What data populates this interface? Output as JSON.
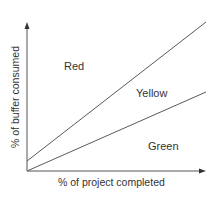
{
  "diagram": {
    "type": "buffer-consumption-zones",
    "x_axis": {
      "label": "% of project completed"
    },
    "y_axis": {
      "label": "% of buffer consumed"
    },
    "regions": [
      {
        "name": "Red",
        "position": "above upper line"
      },
      {
        "name": "Yellow",
        "position": "between lines"
      },
      {
        "name": "Green",
        "position": "below lower line"
      }
    ],
    "lines": [
      {
        "name": "red-yellow-boundary",
        "start": [
          0,
          10
        ],
        "end": [
          100,
          100
        ]
      },
      {
        "name": "yellow-green-boundary",
        "start": [
          0,
          0
        ],
        "end": [
          100,
          53
        ]
      }
    ],
    "colors": {
      "line": "#5a5a5a",
      "axis": "#444444",
      "text": "#333333",
      "background": "#ffffff"
    }
  },
  "labels": {
    "red": "Red",
    "yellow": "Yellow",
    "green": "Green",
    "x_axis": "% of project completed",
    "y_axis": "% of buffer consumed"
  }
}
